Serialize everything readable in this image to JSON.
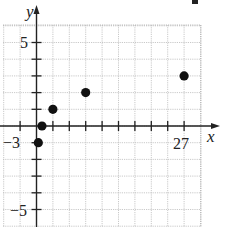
{
  "chart_data": {
    "type": "scatter",
    "title": "",
    "xlabel": "x",
    "ylabel": "y",
    "x_tick_labels": [
      {
        "value": -3,
        "label": "-3"
      },
      {
        "value": 27,
        "label": "27"
      }
    ],
    "y_tick_labels": [
      {
        "value": 5,
        "label": "5"
      },
      {
        "value": -5,
        "label": "-5"
      }
    ],
    "x_tick_step": 3,
    "y_tick_step": 1,
    "xlim": [
      -6,
      30
    ],
    "ylim": [
      -6,
      6
    ],
    "grid": true,
    "legend": null,
    "series": [
      {
        "name": "points",
        "points": [
          {
            "x": 0.333,
            "y": -1
          },
          {
            "x": 1,
            "y": 0
          },
          {
            "x": 3,
            "y": 1
          },
          {
            "x": 9,
            "y": 2
          },
          {
            "x": 27,
            "y": 3
          }
        ]
      }
    ]
  },
  "labels": {
    "x_axis": "x",
    "y_axis": "y",
    "x_min_tick": "−3",
    "x_max_tick": "27",
    "y_max_tick": "5",
    "y_min_tick": "−5"
  }
}
